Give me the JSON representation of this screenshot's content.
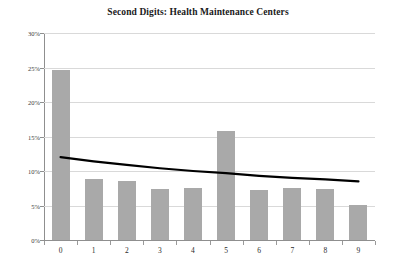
{
  "chart_data": {
    "type": "bar",
    "title": "Second Digits: Health Maintenance Centers",
    "xlabel": "",
    "ylabel": "",
    "categories": [
      "0",
      "1",
      "2",
      "3",
      "4",
      "5",
      "6",
      "7",
      "8",
      "9"
    ],
    "values": [
      24.6,
      8.9,
      8.6,
      7.4,
      7.6,
      15.8,
      7.3,
      7.5,
      7.4,
      5.1
    ],
    "series": [
      {
        "name": "Second Digit Frequency",
        "type": "bar",
        "values": [
          24.6,
          8.9,
          8.6,
          7.4,
          7.6,
          15.8,
          7.3,
          7.5,
          7.4,
          5.1
        ]
      },
      {
        "name": "Benford Expected",
        "type": "line",
        "values": [
          12.0,
          11.4,
          10.9,
          10.4,
          10.0,
          9.7,
          9.3,
          9.0,
          8.8,
          8.5
        ]
      }
    ],
    "ylim": [
      0,
      30
    ],
    "yticks": [
      0,
      5,
      10,
      15,
      20,
      25,
      30
    ],
    "ytick_labels": [
      "0%",
      "5%",
      "10%",
      "15%",
      "20%",
      "25%",
      "30%"
    ],
    "xtick_labels": [
      "0",
      "1",
      "2",
      "3",
      "4",
      "5",
      "6",
      "7",
      "8",
      "9"
    ],
    "grid": true,
    "legend": "none",
    "bar_color": "#a9a9a9",
    "line_color": "#000000",
    "gridline_color": "#d9d9d9",
    "axis_color": "#8f8f8f"
  }
}
